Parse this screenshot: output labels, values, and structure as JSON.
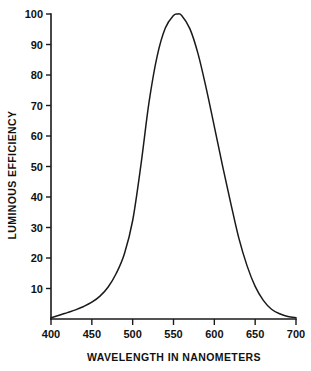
{
  "chart_data": {
    "type": "line",
    "title": "",
    "subtitle": "",
    "xlabel": "WAVELENGTH IN NANOMETERS",
    "ylabel": "LUMINOUS EFFICIENCY",
    "xlim": [
      400,
      700
    ],
    "ylim": [
      0,
      100
    ],
    "xticks": [
      400,
      450,
      500,
      550,
      600,
      650,
      700
    ],
    "yticks": [
      10,
      20,
      30,
      40,
      50,
      60,
      70,
      80,
      90,
      100
    ],
    "xtick_labels": [
      "400",
      "450",
      "500",
      "550",
      "600",
      "650",
      "700"
    ],
    "ytick_labels": [
      "10",
      "20",
      "30",
      "40",
      "50",
      "60",
      "70",
      "80",
      "90",
      "100"
    ],
    "grid": false,
    "legend": false,
    "legend_position": "none",
    "line_color": "#1a1a1a",
    "background_color": "#ffffff",
    "series": [
      {
        "name": "Photopic luminous efficiency V(lambda)",
        "x": [
          400,
          410,
          420,
          430,
          440,
          450,
          460,
          470,
          480,
          490,
          500,
          510,
          520,
          530,
          540,
          550,
          555,
          560,
          570,
          580,
          590,
          600,
          610,
          620,
          630,
          640,
          650,
          660,
          670,
          680,
          690,
          700
        ],
        "values": [
          0.4,
          1.2,
          2.1,
          3.0,
          4.1,
          5.5,
          7.5,
          10.5,
          15.0,
          21.5,
          32.3,
          50.3,
          71.0,
          86.2,
          95.4,
          99.5,
          100.0,
          99.5,
          95.2,
          87.0,
          75.7,
          63.1,
          50.3,
          38.1,
          26.5,
          17.5,
          10.7,
          6.1,
          3.2,
          1.7,
          0.8,
          0.4
        ]
      }
    ]
  },
  "axes": {
    "x_title": "WAVELENGTH IN NANOMETERS",
    "y_title": "LUMINOUS EFFICIENCY"
  }
}
